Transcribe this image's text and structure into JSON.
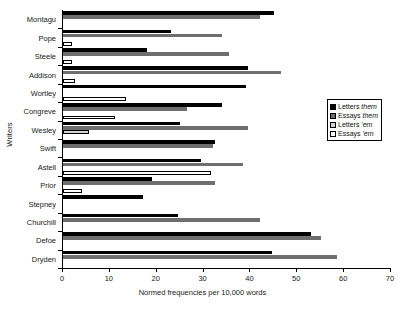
{
  "chart_data": {
    "type": "bar",
    "orientation": "horizontal",
    "title": "",
    "xlabel": "Normed frequencies per 10,000 words",
    "ylabel": "Writers",
    "xlim": [
      0,
      70
    ],
    "xticks": [
      0,
      10,
      20,
      30,
      40,
      50,
      60,
      70
    ],
    "grid": false,
    "legend_position": "center right",
    "categories": [
      "Montagu",
      "Pope",
      "Steele",
      "Addison",
      "Wortley",
      "Congreve",
      "Wesley",
      "Swift",
      "Astell",
      "Prior",
      "Stepney",
      "Churchill",
      "Defoe",
      "Dryden"
    ],
    "series": [
      {
        "name": "Letters them",
        "name_plain": "Letters",
        "name_italic": "them",
        "color": "#000000",
        "values": [
          45.0,
          23.0,
          18.0,
          39.5,
          39.0,
          34.0,
          25.0,
          32.5,
          29.5,
          19.0,
          17.0,
          24.5,
          53.0,
          44.5
        ]
      },
      {
        "name": "Essays them",
        "name_plain": "Essays",
        "name_italic": "them",
        "color": "#6e6e6e",
        "values": [
          42.0,
          34.0,
          35.5,
          46.5,
          0.0,
          26.5,
          39.5,
          32.0,
          38.5,
          32.5,
          0.0,
          42.0,
          55.0,
          58.5
        ]
      },
      {
        "name": "Letters 'em",
        "name_plain": "Letters",
        "name_italic": "'em",
        "color": "#d2d2d2",
        "values": [
          0.0,
          0.0,
          0.0,
          0.0,
          0.0,
          0.0,
          5.5,
          0.0,
          0.0,
          0.0,
          0.0,
          0.0,
          0.0,
          0.0
        ]
      },
      {
        "name": "Essays 'em",
        "name_plain": "Essays",
        "name_italic": "'em",
        "color": "#ffffff",
        "values": [
          0.0,
          2.0,
          2.0,
          2.5,
          13.5,
          11.0,
          0.0,
          0.0,
          31.5,
          4.0,
          0.0,
          0.0,
          0.0,
          0.0
        ]
      }
    ]
  }
}
